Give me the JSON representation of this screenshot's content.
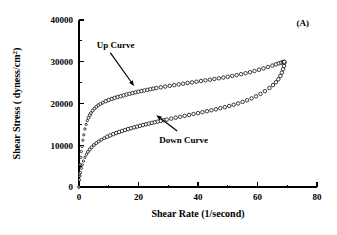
{
  "figure": {
    "panel_label": "(A)",
    "background_color": "#ffffff",
    "foreground_color": "#000000"
  },
  "chart_data": {
    "type": "scatter",
    "title": "",
    "subtitle": "",
    "xlabel": "Shear Rate (1/second)",
    "ylabel": "Shear Stress ( dyness/cm2)",
    "ylabel_display": "Shear Stress ( dyness/cm",
    "ylabel_exponent": "2",
    "ylabel_suffix": ")",
    "xlim": [
      0,
      80
    ],
    "ylim": [
      0,
      40000
    ],
    "xticks": [
      0,
      20,
      40,
      60,
      80
    ],
    "xtick_labels": [
      "0",
      "20",
      "40",
      "60",
      "80"
    ],
    "xticks_minor": [
      10,
      30,
      50,
      70
    ],
    "yticks": [
      0,
      10000,
      20000,
      30000,
      40000
    ],
    "ytick_labels": [
      "0",
      "10000",
      "20000",
      "30000",
      "40000"
    ],
    "yticks_minor": [
      5000,
      15000,
      25000,
      35000
    ],
    "grid": false,
    "legend_position": "none",
    "marker_style": "open-circle",
    "series": [
      {
        "name": "Up Curve",
        "annotation": "Up  Curve",
        "marker": "open-circle",
        "points": [
          [
            0.0,
            0
          ],
          [
            0.2,
            3200
          ],
          [
            0.4,
            5400
          ],
          [
            0.6,
            7100
          ],
          [
            0.8,
            8500
          ],
          [
            1.0,
            9700
          ],
          [
            1.3,
            11200
          ],
          [
            1.6,
            12500
          ],
          [
            2.0,
            13900
          ],
          [
            2.4,
            15000
          ],
          [
            2.8,
            15900
          ],
          [
            3.2,
            16600
          ],
          [
            3.6,
            17200
          ],
          [
            4.0,
            17700
          ],
          [
            4.6,
            18300
          ],
          [
            5.2,
            18800
          ],
          [
            5.8,
            19200
          ],
          [
            6.5,
            19600
          ],
          [
            7.2,
            19900
          ],
          [
            8.0,
            20200
          ],
          [
            9.0,
            20550
          ],
          [
            10.0,
            20850
          ],
          [
            11.0,
            21100
          ],
          [
            12.0,
            21350
          ],
          [
            13.0,
            21550
          ],
          [
            14.0,
            21750
          ],
          [
            15.0,
            21950
          ],
          [
            16.0,
            22150
          ],
          [
            17.0,
            22330
          ],
          [
            18.0,
            22500
          ],
          [
            19.0,
            22670
          ],
          [
            20.0,
            22830
          ],
          [
            21.0,
            22980
          ],
          [
            22.0,
            23130
          ],
          [
            23.0,
            23280
          ],
          [
            24.0,
            23420
          ],
          [
            25.0,
            23560
          ],
          [
            26.0,
            23700
          ],
          [
            27.5,
            23880
          ],
          [
            29.0,
            24060
          ],
          [
            30.5,
            24230
          ],
          [
            32.0,
            24400
          ],
          [
            33.5,
            24570
          ],
          [
            35.0,
            24740
          ],
          [
            36.5,
            24900
          ],
          [
            38.0,
            25060
          ],
          [
            39.5,
            25220
          ],
          [
            41.0,
            25380
          ],
          [
            42.5,
            25540
          ],
          [
            44.0,
            25700
          ],
          [
            45.5,
            25870
          ],
          [
            47.0,
            26040
          ],
          [
            48.5,
            26220
          ],
          [
            50.0,
            26400
          ],
          [
            51.5,
            26600
          ],
          [
            53.0,
            26800
          ],
          [
            54.5,
            27020
          ],
          [
            56.0,
            27250
          ],
          [
            57.5,
            27500
          ],
          [
            59.0,
            27780
          ],
          [
            60.5,
            28080
          ],
          [
            62.0,
            28400
          ],
          [
            63.5,
            28740
          ],
          [
            65.0,
            29080
          ],
          [
            66.2,
            29380
          ],
          [
            67.2,
            29620
          ],
          [
            68.0,
            29800
          ],
          [
            68.6,
            29920
          ],
          [
            69.0,
            29980
          ]
        ]
      },
      {
        "name": "Down Curve",
        "annotation": "Down  Curve",
        "marker": "open-circle",
        "points": [
          [
            0.0,
            0
          ],
          [
            0.15,
            1700
          ],
          [
            0.3,
            2600
          ],
          [
            0.5,
            3500
          ],
          [
            0.8,
            4500
          ],
          [
            1.1,
            5300
          ],
          [
            1.5,
            6200
          ],
          [
            2.0,
            7100
          ],
          [
            2.5,
            7800
          ],
          [
            3.0,
            8400
          ],
          [
            3.6,
            9000
          ],
          [
            4.2,
            9500
          ],
          [
            5.0,
            10050
          ],
          [
            5.8,
            10500
          ],
          [
            6.6,
            10900
          ],
          [
            7.5,
            11300
          ],
          [
            8.5,
            11700
          ],
          [
            9.5,
            12050
          ],
          [
            10.5,
            12350
          ],
          [
            11.5,
            12650
          ],
          [
            12.5,
            12920
          ],
          [
            13.5,
            13180
          ],
          [
            14.5,
            13420
          ],
          [
            15.5,
            13650
          ],
          [
            16.5,
            13870
          ],
          [
            17.5,
            14080
          ],
          [
            18.5,
            14280
          ],
          [
            19.5,
            14470
          ],
          [
            20.5,
            14660
          ],
          [
            21.5,
            14840
          ],
          [
            22.5,
            15020
          ],
          [
            23.5,
            15190
          ],
          [
            24.5,
            15360
          ],
          [
            25.5,
            15520
          ],
          [
            26.5,
            15680
          ],
          [
            27.5,
            15840
          ],
          [
            28.5,
            16000
          ],
          [
            29.5,
            16150
          ],
          [
            31.0,
            16380
          ],
          [
            32.5,
            16600
          ],
          [
            34.0,
            16820
          ],
          [
            35.5,
            17040
          ],
          [
            37.0,
            17260
          ],
          [
            38.5,
            17480
          ],
          [
            40.0,
            17700
          ],
          [
            41.5,
            17920
          ],
          [
            43.0,
            18150
          ],
          [
            44.5,
            18380
          ],
          [
            46.0,
            18620
          ],
          [
            47.5,
            18870
          ],
          [
            49.0,
            19130
          ],
          [
            50.5,
            19400
          ],
          [
            52.0,
            19700
          ],
          [
            53.5,
            20020
          ],
          [
            55.0,
            20380
          ],
          [
            56.5,
            20780
          ],
          [
            58.0,
            21220
          ],
          [
            59.5,
            21720
          ],
          [
            61.0,
            22300
          ],
          [
            62.5,
            22950
          ],
          [
            64.0,
            23700
          ],
          [
            65.2,
            24400
          ],
          [
            66.2,
            25100
          ],
          [
            67.0,
            25800
          ],
          [
            67.7,
            26600
          ],
          [
            68.2,
            27400
          ],
          [
            68.6,
            28200
          ],
          [
            68.9,
            29000
          ],
          [
            69.0,
            29700
          ],
          [
            69.0,
            29980
          ]
        ]
      }
    ],
    "annotations": [
      {
        "name": "up-curve-annotation",
        "text": "Up  Curve",
        "text_x": 6.0,
        "text_y": 34000,
        "arrow_from_x": 10.5,
        "arrow_from_y": 32200,
        "arrow_to_x": 18.5,
        "arrow_to_y": 24200
      },
      {
        "name": "down-curve-annotation",
        "text": "Down  Curve",
        "text_x": 27.0,
        "text_y": 11200,
        "arrow_from_x": 33.0,
        "arrow_from_y": 13400,
        "arrow_to_x": 26.0,
        "arrow_to_y": 17200
      }
    ]
  }
}
